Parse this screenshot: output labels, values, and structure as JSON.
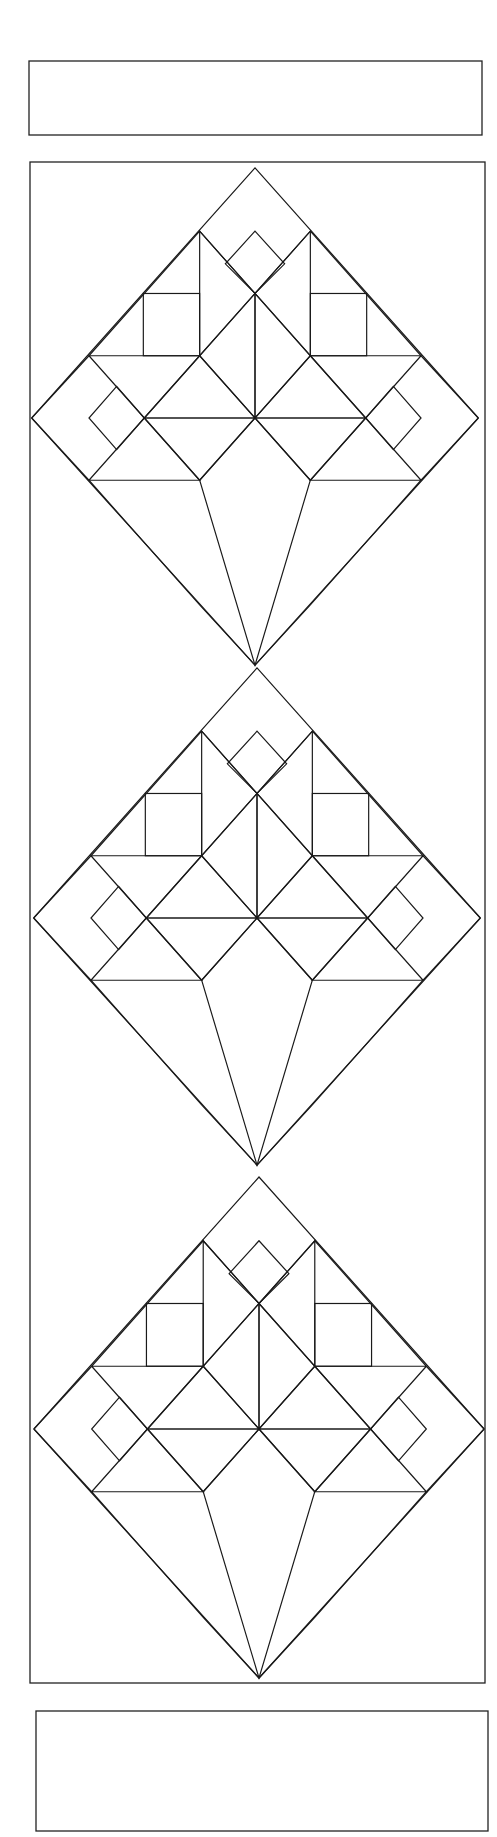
{
  "figure": {
    "title": ""
  },
  "palette": {
    "background": "#ffffff",
    "print_ground": "#fbfbfb",
    "print_speck_dark": "#6e6e6e",
    "print_speck_light": "#b4b4b4",
    "outline": "#1a1a1a",
    "floral_ground": "#0c0c0c",
    "floral_flower_light": "#e4e4e4",
    "floral_flower_mid": "#9a9a9a",
    "floral_swirl": "#8a8a8a",
    "petal_lightest": "#dcdcdc",
    "petal_light": "#c9c9c9",
    "petal_mid": "#a8a8a8",
    "petal_mid_dark": "#8e8e8e",
    "petal_dark": "#6a6a6a",
    "petal_darkest": "#565656"
  },
  "layout": {
    "top_strip": {
      "x": 29,
      "y": 61,
      "width": 453,
      "height": 74
    },
    "main_panel": {
      "x": 30,
      "y": 162,
      "width": 455,
      "height": 1521
    },
    "bottom_strip": {
      "x": 36,
      "y": 1711,
      "width": 452,
      "height": 120
    },
    "blocks": [
      {
        "id": "block-1",
        "center_x": 255,
        "center_y": 418,
        "half_diagonal": 226
      },
      {
        "id": "block-2",
        "center_x": 257,
        "center_y": 918,
        "half_diagonal": 226
      },
      {
        "id": "block-3",
        "center_x": 259,
        "center_y": 1427,
        "half_diagonal": 228
      }
    ]
  },
  "block_parts": [
    {
      "name": "outer-setting-diamond",
      "fabric": "speckled-print"
    },
    {
      "name": "left-tall-petal",
      "fabric": "petal_light"
    },
    {
      "name": "right-tall-petal",
      "fabric": "petal_darkest"
    },
    {
      "name": "top-small-floral-diamond",
      "fabric": "floral"
    },
    {
      "name": "left-floral-square",
      "fabric": "floral"
    },
    {
      "name": "right-floral-square",
      "fabric": "floral"
    },
    {
      "name": "center-left-petal",
      "fabric": "petal_lightest"
    },
    {
      "name": "center-right-petal",
      "fabric": "petal_mid"
    },
    {
      "name": "left-wing-upper",
      "fabric": "petal_mid_dark"
    },
    {
      "name": "right-wing-upper",
      "fabric": "petal_darkest"
    },
    {
      "name": "left-inner-triangle",
      "fabric": "petal_light"
    },
    {
      "name": "right-inner-triangle",
      "fabric": "petal_light"
    },
    {
      "name": "left-lower-band",
      "fabric": "petal_mid"
    },
    {
      "name": "right-lower-band",
      "fabric": "petal_mid"
    },
    {
      "name": "left-wing-lower",
      "fabric": "petal_dark"
    },
    {
      "name": "right-wing-lower",
      "fabric": "petal_dark"
    },
    {
      "name": "left-side-floral-diamond",
      "fabric": "floral"
    },
    {
      "name": "right-side-floral-diamond",
      "fabric": "floral"
    },
    {
      "name": "vase-cone",
      "fabric": "floral"
    }
  ]
}
